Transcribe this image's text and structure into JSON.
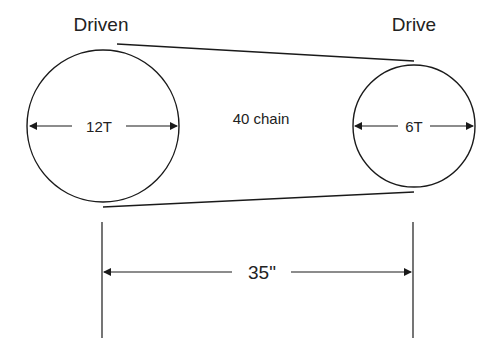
{
  "diagram": {
    "driven": {
      "title": "Driven",
      "teeth_label": "12T"
    },
    "drive": {
      "title": "Drive",
      "teeth_label": "6T"
    },
    "chain_label": "40 chain",
    "center_distance_label": "35\""
  },
  "colors": {
    "line": "#1a1a1a",
    "background": "#ffffff"
  }
}
